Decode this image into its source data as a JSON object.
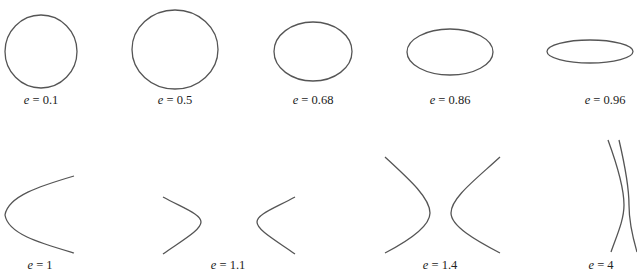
{
  "figure": {
    "stroke_color": "#555555",
    "background": "#ffffff",
    "top_row": [
      {
        "id": "ellipse-e-0-1",
        "type": "ellipse",
        "variable": "e",
        "equals": " = ",
        "value": "0.1",
        "label": "e = 0.1"
      },
      {
        "id": "ellipse-e-0-5",
        "type": "ellipse",
        "variable": "e",
        "equals": " = ",
        "value": "0.5",
        "label": "e = 0.5"
      },
      {
        "id": "ellipse-e-0-68",
        "type": "ellipse",
        "variable": "e",
        "equals": " = ",
        "value": "0.68",
        "label": "e = 0.68"
      },
      {
        "id": "ellipse-e-0-86",
        "type": "ellipse",
        "variable": "e",
        "equals": " = ",
        "value": "0.86",
        "label": "e = 0.86"
      },
      {
        "id": "ellipse-e-0-96",
        "type": "ellipse",
        "variable": "e",
        "equals": " = ",
        "value": "0.96",
        "label": "e = 0.96"
      }
    ],
    "bottom_row": [
      {
        "id": "parabola-e-1",
        "type": "parabola",
        "variable": "e",
        "equals": " = ",
        "value": "1",
        "label": "e = 1"
      },
      {
        "id": "hyperbola-e-1-1",
        "type": "hyperbola",
        "variable": "e",
        "equals": " = ",
        "value": "1.1",
        "label": "e = 1.1"
      },
      {
        "id": "hyperbola-e-1-4",
        "type": "hyperbola",
        "variable": "e",
        "equals": " = ",
        "value": "1.4",
        "label": "e = 1.4"
      },
      {
        "id": "hyperbola-e-4",
        "type": "hyperbola",
        "variable": "e",
        "equals": " = ",
        "value": "4",
        "label": "e = 4"
      }
    ]
  }
}
